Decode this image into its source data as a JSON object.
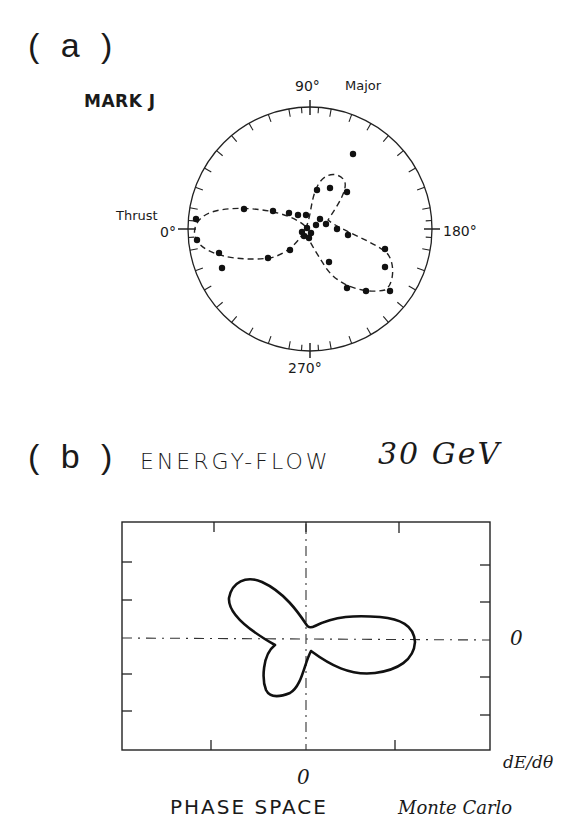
{
  "page": {
    "header_cutoff_text": "",
    "panels": [
      {
        "id": "a",
        "label": "( a )",
        "detector_label": "MARK J",
        "angle_labels": {
          "top": "90°",
          "left": "0°",
          "right": "180°",
          "bottom": "270°"
        },
        "axis_labels": {
          "top_right": "Major",
          "left": "Thrust"
        }
      },
      {
        "id": "b",
        "label": "( b )",
        "title": "ENERGY-FLOW",
        "energy": "30 GeV",
        "y_zero_label": "0",
        "x_zero_label": "0",
        "y_axis_label": "dE/dθ",
        "bottom_label": "PHASE SPACE",
        "method_label": "Monte Carlo"
      }
    ]
  },
  "chart_data": [
    {
      "type": "scatter",
      "title": "MARK J",
      "subtitle": "Polar energy-flow event display (three-jet event)",
      "coordinate_system": "polar",
      "angle_ticks": [
        "0°",
        "90°",
        "180°",
        "270°"
      ],
      "axis_annotations": [
        "Thrust (0°)",
        "Major (90°)"
      ],
      "grid": false,
      "points_svg_coords_approx": [
        [
          353,
          154
        ],
        [
          196,
          219
        ],
        [
          197,
          240
        ],
        [
          244,
          209
        ],
        [
          273,
          211
        ],
        [
          289,
          212
        ],
        [
          298,
          214
        ],
        [
          306,
          214
        ],
        [
          317,
          189
        ],
        [
          330,
          188
        ],
        [
          347,
          191
        ],
        [
          322,
          218
        ],
        [
          318,
          225
        ],
        [
          323,
          222
        ],
        [
          337,
          229
        ],
        [
          348,
          235
        ],
        [
          306,
          228
        ],
        [
          309,
          232
        ],
        [
          304,
          236
        ],
        [
          309,
          238
        ],
        [
          303,
          233
        ],
        [
          290,
          250
        ],
        [
          268,
          257
        ],
        [
          219,
          254
        ],
        [
          222,
          268
        ],
        [
          329,
          262
        ],
        [
          385,
          249
        ],
        [
          385,
          268
        ],
        [
          347,
          288
        ],
        [
          366,
          291
        ],
        [
          390,
          291
        ]
      ],
      "fitted_contour": "dashed three-lobe curve (lobes toward 0°, ~80°, ~200°)"
    },
    {
      "type": "line",
      "title": "ENERGY-FLOW 30 GeV",
      "subtitle": "Monte Carlo",
      "xlabel": "PHASE SPACE",
      "ylabel": "dE/dθ",
      "x_zero": "0",
      "y_zero": "0",
      "grid": false,
      "description": "Solid three-lobe closed contour centered at origin: one lobe up-left, one lobe down-left (smaller), one large lobe to the right",
      "axes_lines": "dash-dot crosshair through origin"
    }
  ]
}
